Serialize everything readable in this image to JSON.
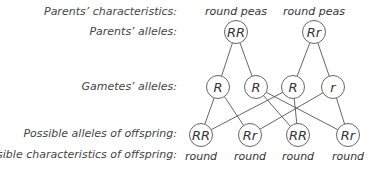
{
  "labels": {
    "parents_characteristics": "Parents’ characteristics:",
    "parents_alleles": "Parents’ alleles:",
    "gametes_alleles": "Gametes’ alleles:",
    "offspring_alleles": "Possible alleles of offspring:",
    "offspring_characteristics": "Possible characteristics of offspring:"
  },
  "parents": [
    {
      "characteristic": "round peas",
      "alleles": "RR"
    },
    {
      "characteristic": "round peas",
      "alleles": "Rr"
    }
  ],
  "gametes": [
    "R",
    "R",
    "R",
    "r"
  ],
  "offspring": [
    {
      "alleles": "RR",
      "characteristic": "round"
    },
    {
      "alleles": "Rr",
      "characteristic": "round"
    },
    {
      "alleles": "RR",
      "characteristic": "round"
    },
    {
      "alleles": "Rr",
      "characteristic": "round"
    }
  ],
  "edges": {
    "parent_to_gamete": [
      [
        0,
        0
      ],
      [
        0,
        1
      ],
      [
        1,
        2
      ],
      [
        1,
        3
      ]
    ],
    "gamete_to_offspring": [
      [
        0,
        0
      ],
      [
        0,
        1
      ],
      [
        1,
        2
      ],
      [
        1,
        3
      ],
      [
        2,
        0
      ],
      [
        2,
        2
      ],
      [
        3,
        1
      ],
      [
        3,
        3
      ]
    ]
  }
}
